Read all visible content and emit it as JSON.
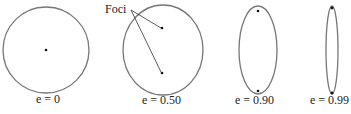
{
  "diagram": {
    "annotation": {
      "label": "Foci"
    },
    "shapes": [
      {
        "type": "circle",
        "eccentricity_label": "e = 0",
        "eccentricity": 0
      },
      {
        "type": "ellipse",
        "eccentricity_label": "e = 0.50",
        "eccentricity": 0.5
      },
      {
        "type": "ellipse",
        "eccentricity_label": "e = 0.90",
        "eccentricity": 0.9
      },
      {
        "type": "ellipse",
        "eccentricity_label": "e = 0.99",
        "eccentricity": 0.99
      }
    ],
    "colors": {
      "outline": "#777777",
      "focus": "#111111",
      "text": "#222222"
    }
  }
}
